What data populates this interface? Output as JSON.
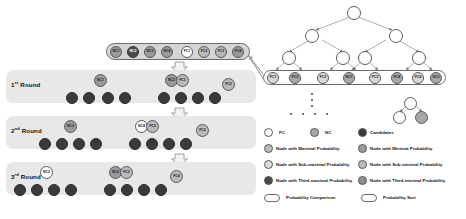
{
  "diagram": {
    "rounds": [
      {
        "label_main": "1",
        "label_sup": "st",
        "label_word": "Round"
      },
      {
        "label_main": "2",
        "label_sup": "nd",
        "label_word": "Round"
      },
      {
        "label_main": "3",
        "label_sup": "rd",
        "label_word": "Round"
      }
    ],
    "candidate_bar": {
      "nodes": [
        {
          "text": "NC1",
          "kind": "min"
        },
        {
          "text": "NC2",
          "kind": "third-max"
        },
        {
          "text": "NC3",
          "kind": "min"
        },
        {
          "text": "NC4",
          "kind": "min"
        },
        {
          "text": "FC1",
          "kind": "white"
        },
        {
          "text": "FC2",
          "kind": "max"
        },
        {
          "text": "FC3",
          "kind": "max"
        },
        {
          "text": "FC4",
          "kind": "min"
        }
      ]
    },
    "round1": {
      "compare_left": {
        "text": "NC1",
        "kind": "min"
      },
      "compare_center": [
        {
          "text": "NC2",
          "kind": "min"
        },
        {
          "text": "FC1",
          "kind": "max"
        }
      ],
      "compare_right": {
        "text": "FC2",
        "kind": "max"
      },
      "candidates": [
        "",
        "",
        "",
        "",
        "",
        "",
        "",
        ""
      ]
    },
    "round2": {
      "compare_left": {
        "text": "NC3",
        "kind": "min"
      },
      "compare_center": [
        {
          "text": "NC4",
          "kind": "white"
        },
        {
          "text": "FC3",
          "kind": "max"
        }
      ],
      "compare_right": {
        "text": "FC2",
        "kind": "max"
      },
      "candidates": [
        "",
        "",
        "",
        "",
        "",
        "",
        "",
        ""
      ]
    },
    "round3": {
      "compare_left": {
        "text": "NC2",
        "kind": "white"
      },
      "compare_center": [
        {
          "text": "NC3",
          "kind": "min"
        },
        {
          "text": "FC2",
          "kind": "max"
        }
      ],
      "compare_right": {
        "text": "FC4",
        "kind": "max"
      },
      "candidates": [
        "",
        "",
        "",
        "",
        "",
        "",
        "",
        ""
      ]
    },
    "tree": {
      "root": {
        "text": "",
        "kind": "white"
      },
      "level2": [
        {
          "text": "",
          "kind": "white"
        },
        {
          "text": "",
          "kind": "white"
        }
      ],
      "level3": [
        {
          "text": "",
          "kind": "white"
        },
        {
          "text": "",
          "kind": "white"
        },
        {
          "text": "",
          "kind": "white"
        },
        {
          "text": "",
          "kind": "white"
        }
      ],
      "leaves": [
        {
          "text": "FC1",
          "kind": "fc"
        },
        {
          "text": "FC2",
          "kind": "nc"
        },
        {
          "text": "FC2",
          "kind": "fc"
        },
        {
          "text": "NC1",
          "kind": "nc"
        },
        {
          "text": "FC3",
          "kind": "fc"
        },
        {
          "text": "FC4",
          "kind": "nc"
        },
        {
          "text": "FC4",
          "kind": "fc"
        },
        {
          "text": "NC2",
          "kind": "nc"
        }
      ],
      "mini_pair": [
        {
          "text": "",
          "kind": "white"
        },
        {
          "text": "",
          "kind": "nc"
        }
      ]
    }
  },
  "legend": {
    "row1": [
      {
        "swatch": "white",
        "label": "FC"
      },
      {
        "swatch": "nc",
        "label": "NC"
      },
      {
        "swatch": "cand",
        "label": "Candidates"
      }
    ],
    "row2": [
      {
        "swatch": "max",
        "label": "Node with Maximal Probability"
      },
      {
        "swatch": "min",
        "label": "Node with Minimal Probability"
      }
    ],
    "row3": [
      {
        "swatch": "submax",
        "label": "Node with Sub-maximal Probability"
      },
      {
        "swatch": "submin",
        "label": "Node with Sub-minimal Probability"
      }
    ],
    "row4": [
      {
        "swatch": "third-max",
        "label": "Node with Third-maximal Probability"
      },
      {
        "swatch": "third-min",
        "label": "Node with Third-minimal Probability"
      }
    ],
    "row5": [
      {
        "shape": "capsule",
        "label": "Probability Comparison"
      },
      {
        "shape": "capsule",
        "label": "Probability Sort"
      }
    ]
  }
}
